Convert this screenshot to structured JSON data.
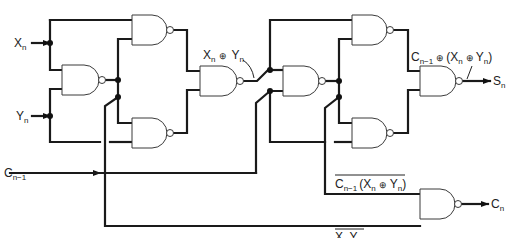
{
  "diagram": {
    "type": "logic-circuit",
    "inputs": {
      "x": {
        "base": "X",
        "sub": "n"
      },
      "y": {
        "base": "Y",
        "sub": "n"
      },
      "cin": {
        "base": "C",
        "sub": "n−1"
      }
    },
    "outputs": {
      "sum": {
        "base": "S",
        "sub": "n"
      },
      "carry": {
        "base": "C",
        "sub": "n"
      }
    },
    "annotations": {
      "xor1": {
        "x": "X",
        "xs": "n",
        "op": "⊕",
        "y": "Y",
        "ys": "n"
      },
      "xor2": {
        "c": "C",
        "cs": "n−1",
        "op1": "⊕",
        "open": "(",
        "x": "X",
        "xs": "n",
        "op2": "⊕",
        "y": "Y",
        "ys": "n",
        "close": ")"
      },
      "nand_c": {
        "c": "C",
        "cs": "n−1",
        "open": "(",
        "x": "X",
        "xs": "n",
        "op": "⊕",
        "y": "Y",
        "ys": "n",
        "close": ")"
      },
      "nand_xy": {
        "x": "X",
        "xs": "n",
        "y": "Y",
        "ys": "n"
      }
    },
    "gates": [
      "nand-1",
      "nand-2",
      "nand-3",
      "nand-4",
      "nand-5",
      "nand-6",
      "nand-7",
      "nand-8",
      "nand-9"
    ]
  }
}
